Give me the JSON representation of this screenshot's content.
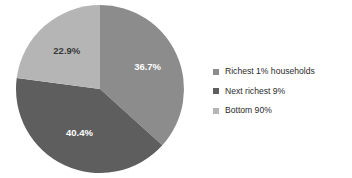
{
  "chart_data": {
    "type": "pie",
    "title": "",
    "subtitle": "",
    "xlabel": "",
    "ylabel": "",
    "grid": false,
    "legend_position": "right",
    "start_angle_deg": 0,
    "direction": "clockwise",
    "categories": [
      "Richest 1% households",
      "Next richest 9%",
      "Bottom 90%"
    ],
    "values": [
      36.7,
      40.4,
      22.9
    ],
    "value_unit": "percent",
    "data_labels": [
      "36.7%",
      "40.4%",
      "22.9%"
    ],
    "slices": [
      {
        "label": "Richest 1% households",
        "value": 36.7,
        "data_label": "36.7%",
        "color": "#8c8c8c",
        "label_color": "#ffffff"
      },
      {
        "label": "Next richest 9%",
        "value": 40.4,
        "data_label": "40.4%",
        "color": "#5e5e5e",
        "label_color": "#ffffff"
      },
      {
        "label": "Bottom 90%",
        "value": 22.9,
        "data_label": "22.9%",
        "color": "#b5b5b5",
        "label_color": "#3a3a3a"
      }
    ]
  },
  "legend": {
    "items": [
      {
        "label": "Richest 1% households",
        "color": "#8c8c8c"
      },
      {
        "label": "Next richest 9%",
        "color": "#5e5e5e"
      },
      {
        "label": "Bottom 90%",
        "color": "#b5b5b5"
      }
    ]
  },
  "canvas": {
    "background": "#ffffff"
  }
}
